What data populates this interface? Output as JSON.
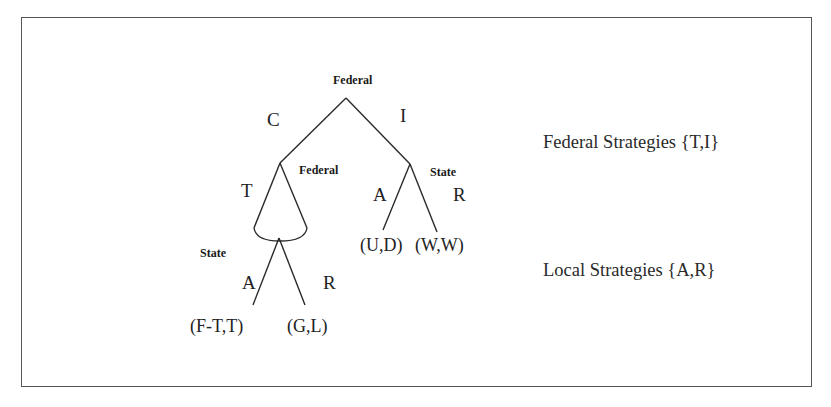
{
  "diagram": {
    "type": "extensive-form game tree",
    "colors": {
      "line": "#2a2a2a",
      "text": "#222222",
      "frame": "#555555",
      "background": "#ffffff"
    },
    "nodes": {
      "root": {
        "player": "Federal"
      },
      "federal_inner": {
        "player": "Federal"
      },
      "state_right": {
        "player": "State"
      },
      "state_left": {
        "player": "State"
      }
    },
    "moves": {
      "root_left": "C",
      "root_right": "I",
      "federal_left": "T",
      "state_right_left": "A",
      "state_right_right": "R",
      "state_left_left": "A",
      "state_left_right": "R"
    },
    "payoffs": {
      "ft_t": "(F-T,T)",
      "g_l": "(G,L)",
      "u_d": "(U,D)",
      "w_w": "(W,W)"
    },
    "legend": {
      "federal_strategies": "Federal Strategies {T,I}",
      "local_strategies": "Local Strategies {A,R}"
    }
  }
}
